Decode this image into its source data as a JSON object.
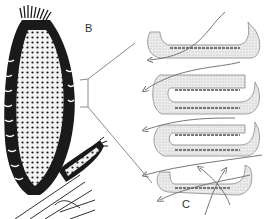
{
  "figure": {
    "labels": {
      "b": "B",
      "c": "C"
    },
    "panels": [
      {
        "id": "B",
        "description": "sponge body with osculum fringe and bud, attached to substrate"
      },
      {
        "id": "C",
        "description": "canal system cross-section with water-flow arrows"
      }
    ],
    "colors": {
      "ink": "#1a1a1a",
      "gray_line": "#8a8a8a",
      "stipple": "#cfcfcf"
    }
  }
}
